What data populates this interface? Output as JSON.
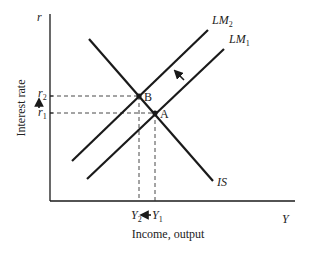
{
  "diagram": {
    "type": "IS-LM model",
    "axes": {
      "y_axis_label": "Interest rate",
      "y_axis_symbol": "r",
      "x_axis_label": "Income, output",
      "x_axis_symbol": "Y"
    },
    "curves": {
      "is": {
        "label": "IS"
      },
      "lm1": {
        "label_main": "LM",
        "label_sub": "1"
      },
      "lm2": {
        "label_main": "LM",
        "label_sub": "2"
      }
    },
    "points": {
      "a": {
        "label": "A"
      },
      "b": {
        "label": "B"
      }
    },
    "y_ticks": {
      "r1": {
        "main": "r",
        "sub": "1"
      },
      "r2": {
        "main": "r",
        "sub": "2"
      }
    },
    "x_ticks": {
      "y1": {
        "main": "Y",
        "sub": "1"
      },
      "y2": {
        "main": "Y",
        "sub": "2"
      }
    },
    "shift_arrows": [
      {
        "name": "lm-shift-arrow",
        "direction": "up-left",
        "meaning": "LM1 shifts to LM2"
      },
      {
        "name": "interest-rate-rise-arrow",
        "direction": "up",
        "meaning": "r rises from r1 to r2"
      },
      {
        "name": "income-fall-arrow",
        "direction": "left",
        "meaning": "Y falls from Y1 to Y2"
      }
    ],
    "colors": {
      "line": "#1a1a1a",
      "text": "#222222",
      "background": "#ffffff"
    }
  }
}
